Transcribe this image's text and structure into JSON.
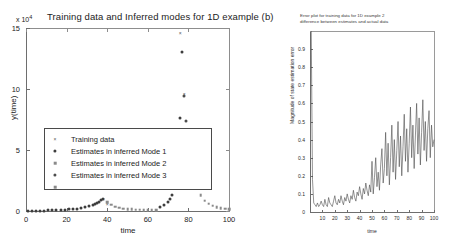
{
  "left_plot": {
    "title": "Training data and Inferred modes for 1D example (b)",
    "exponent_prefix": "x 10",
    "exponent_power": "4",
    "xlabel": "time",
    "ylabel": "y(time)",
    "xticks": [
      "0",
      "20",
      "40",
      "60",
      "80",
      "100"
    ],
    "yticks": [
      "0",
      "5",
      "10",
      "15"
    ],
    "legend": [
      {
        "label": "Training data",
        "marker": "x",
        "color": "#555555"
      },
      {
        "label": "Estimates in inferred Mode 1",
        "marker": "dot",
        "color": "#3d3d3d"
      },
      {
        "label": "Estimates in inferred Mode 2",
        "marker": "square",
        "color": "#8a8a8a"
      },
      {
        "label": "Estimates in inferred Mode 3",
        "marker": "dot",
        "color": "#4d4d4d"
      }
    ]
  },
  "right_plot": {
    "title_line1": "Error plot for training data for 1D example 2",
    "title_line2": "difference between estimates and actual data",
    "xlabel": "time",
    "ylabel": "Magnitude of state estimation error",
    "xticks": [
      "10",
      "20",
      "30",
      "40",
      "50",
      "60",
      "70",
      "80",
      "90",
      "100"
    ],
    "yticks": [
      "0",
      "0.1",
      "0.2",
      "0.3",
      "0.4",
      "0.5",
      "0.6",
      "0.7",
      "0.8",
      "0.9"
    ]
  },
  "chart_data": [
    {
      "type": "scatter",
      "title": "Training data and Inferred modes for 1D example (b)",
      "xlabel": "time",
      "ylabel": "y(time)",
      "y_scale_multiplier": 10000,
      "xlim": [
        0,
        100
      ],
      "ylim": [
        0,
        15
      ],
      "grid": false,
      "legend": [
        "Training data",
        "Estimates in inferred Mode 1",
        "Estimates in inferred Mode 2",
        "Estimates in inferred Mode 3"
      ],
      "legend_position": "center-left",
      "series": [
        {
          "name": "Training data",
          "marker": "x",
          "x": [
            38,
            40,
            76,
            78,
            80,
            82,
            84
          ],
          "y": [
            0.95,
            0.55,
            14.6,
            9.6,
            6.0,
            4.0,
            2.2
          ]
        },
        {
          "name": "Estimates in inferred Mode 1",
          "marker": "dot",
          "x": [
            1,
            3,
            5,
            7,
            9,
            11,
            13,
            15,
            17,
            19,
            21,
            23,
            25,
            27,
            29,
            31,
            33,
            34,
            35,
            36,
            37,
            38,
            66,
            68,
            70,
            71,
            72,
            73,
            74,
            75,
            76,
            77
          ],
          "y": [
            0.02,
            0.02,
            0.03,
            0.03,
            0.04,
            0.05,
            0.06,
            0.07,
            0.09,
            0.11,
            0.13,
            0.16,
            0.2,
            0.25,
            0.31,
            0.39,
            0.5,
            0.58,
            0.66,
            0.76,
            0.87,
            1.0,
            0.35,
            0.5,
            0.75,
            0.95,
            1.3,
            1.9,
            2.9,
            4.6,
            7.6,
            13.0
          ]
        },
        {
          "name": "Estimates in inferred Mode 2",
          "marker": "square",
          "x": [
            40,
            42,
            44,
            46,
            48,
            50,
            52,
            54,
            56,
            58,
            60,
            62,
            64,
            80,
            82,
            84,
            86,
            88,
            90,
            92,
            94,
            96,
            98,
            100
          ],
          "y": [
            0.72,
            0.5,
            0.35,
            0.26,
            0.2,
            0.16,
            0.13,
            0.1,
            0.09,
            0.08,
            0.07,
            0.06,
            0.05,
            5.6,
            3.4,
            2.1,
            1.3,
            0.85,
            0.6,
            0.42,
            0.32,
            0.25,
            0.2,
            0.17
          ]
        },
        {
          "name": "Estimates in inferred Mode 3",
          "marker": "dot",
          "x": [
            78,
            79,
            80,
            81
          ],
          "y": [
            9.4,
            7.4,
            5.9,
            4.6
          ]
        }
      ]
    },
    {
      "type": "line",
      "title": "Error plot for training data for 1D example 2 / difference between estimates and actual data",
      "xlabel": "time",
      "ylabel": "Magnitude of state estimation error",
      "xlim": [
        0,
        100
      ],
      "ylim": [
        0,
        1.0
      ],
      "grid": false,
      "series": [
        {
          "name": "estimation error",
          "x": [
            1,
            2,
            3,
            4,
            5,
            6,
            7,
            8,
            9,
            10,
            11,
            12,
            13,
            14,
            15,
            16,
            17,
            18,
            19,
            20,
            21,
            22,
            23,
            24,
            25,
            26,
            27,
            28,
            29,
            30,
            31,
            32,
            33,
            34,
            35,
            36,
            37,
            38,
            39,
            40,
            41,
            42,
            43,
            44,
            45,
            46,
            47,
            48,
            49,
            50,
            51,
            52,
            53,
            54,
            55,
            56,
            57,
            58,
            59,
            60,
            61,
            62,
            63,
            64,
            65,
            66,
            67,
            68,
            69,
            70,
            71,
            72,
            73,
            74,
            75,
            76,
            77,
            78,
            79,
            80,
            81,
            82,
            83,
            84,
            85,
            86,
            87,
            88,
            89,
            90,
            91,
            92,
            93,
            94,
            95,
            96,
            97,
            98,
            99,
            100
          ],
          "y": [
            1.0,
            0.18,
            0.05,
            0.04,
            0.03,
            0.05,
            0.03,
            0.04,
            0.06,
            0.04,
            0.03,
            0.07,
            0.04,
            0.03,
            0.08,
            0.05,
            0.04,
            0.03,
            0.06,
            0.09,
            0.05,
            0.04,
            0.07,
            0.05,
            0.09,
            0.06,
            0.04,
            0.08,
            0.06,
            0.1,
            0.07,
            0.05,
            0.09,
            0.07,
            0.12,
            0.08,
            0.06,
            0.11,
            0.09,
            0.14,
            0.1,
            0.07,
            0.13,
            0.1,
            0.16,
            0.12,
            0.09,
            0.15,
            0.11,
            0.28,
            0.1,
            0.19,
            0.3,
            0.14,
            0.22,
            0.12,
            0.26,
            0.35,
            0.16,
            0.24,
            0.44,
            0.2,
            0.38,
            0.15,
            0.3,
            0.48,
            0.22,
            0.4,
            0.18,
            0.34,
            0.5,
            0.25,
            0.42,
            0.2,
            0.36,
            0.54,
            0.28,
            0.46,
            0.22,
            0.38,
            0.58,
            0.3,
            0.48,
            0.24,
            0.42,
            0.6,
            0.32,
            0.52,
            0.26,
            0.44,
            0.62,
            0.34,
            0.5,
            0.28,
            0.46,
            0.56,
            0.3,
            0.48,
            0.36,
            0.4
          ]
        }
      ]
    }
  ]
}
